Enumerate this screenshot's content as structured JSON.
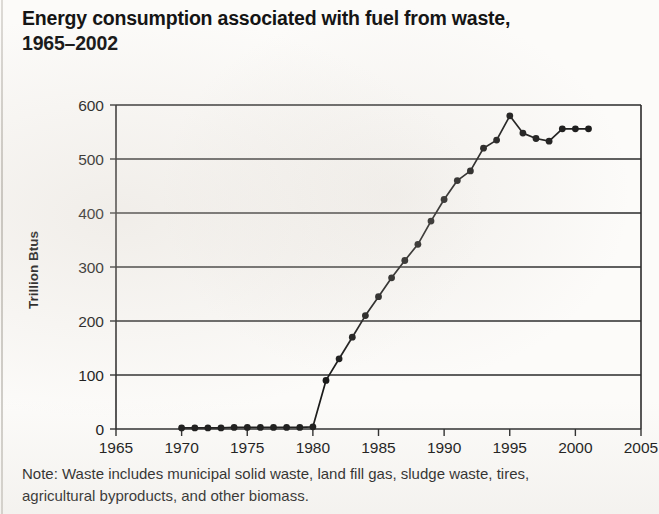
{
  "title": {
    "line1": "Energy consumption associated with fuel from waste,",
    "line2": "1965–2002"
  },
  "note": {
    "line1": "Note: Waste includes municipal solid waste, land fill gas, sludge waste, tires,",
    "line2": "agricultural byproducts, and other biomass."
  },
  "chart_data": {
    "type": "line",
    "xlabel": "",
    "ylabel": "Trillion Btus",
    "xlim": [
      1965,
      2005
    ],
    "ylim": [
      0,
      600
    ],
    "xticks": [
      1965,
      1970,
      1975,
      1980,
      1985,
      1990,
      1995,
      2000,
      2005
    ],
    "yticks": [
      0,
      100,
      200,
      300,
      400,
      500,
      600
    ],
    "grid": "horizontal",
    "legend": "none",
    "marker": "filled-circle",
    "line_color": "#1a1a1a",
    "x": [
      1970,
      1971,
      1972,
      1973,
      1974,
      1975,
      1976,
      1977,
      1978,
      1979,
      1980,
      1981,
      1982,
      1983,
      1984,
      1985,
      1986,
      1987,
      1988,
      1989,
      1990,
      1991,
      1992,
      1993,
      1994,
      1995,
      1996,
      1997,
      1998,
      1999,
      2000,
      2001
    ],
    "values": [
      2,
      2,
      2,
      2,
      3,
      3,
      3,
      3,
      3,
      3,
      4,
      90,
      130,
      170,
      210,
      245,
      280,
      312,
      342,
      385,
      425,
      460,
      478,
      520,
      535,
      580,
      548,
      538,
      533,
      556,
      556,
      556
    ],
    "series": [
      {
        "name": "Energy consumption from waste (Trillion Btus)",
        "values": [
          2,
          2,
          2,
          2,
          3,
          3,
          3,
          3,
          3,
          3,
          4,
          90,
          130,
          170,
          210,
          245,
          280,
          312,
          342,
          385,
          425,
          460,
          478,
          520,
          535,
          580,
          548,
          538,
          533,
          556,
          556,
          556
        ]
      }
    ],
    "annotations": []
  }
}
